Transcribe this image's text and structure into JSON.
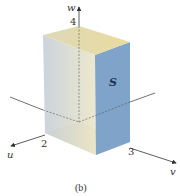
{
  "figure": {
    "caption": "(b)",
    "solid_label": "S",
    "axes": {
      "u": {
        "label": "u",
        "tick": "2"
      },
      "v": {
        "label": "v",
        "tick": "3"
      },
      "w": {
        "label": "w",
        "tick": "4"
      }
    },
    "colors": {
      "top_face": "#e8dca8",
      "bottom_face": "#e6d49a",
      "left_face": "#c9d3dc",
      "right_face": "#7fa3c9",
      "front_face": "#e4e0c8",
      "axis": "#333333"
    }
  }
}
